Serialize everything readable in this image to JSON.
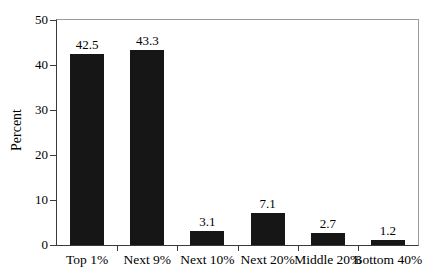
{
  "chart_data": {
    "type": "bar",
    "title": "",
    "xlabel": "",
    "ylabel": "Percent",
    "categories": [
      "Top 1%",
      "Next 9%",
      "Next 10%",
      "Next 20%",
      "Middle 20%",
      "Bottom 40%"
    ],
    "values": [
      42.5,
      43.3,
      3.1,
      7.1,
      2.7,
      1.2
    ],
    "value_labels": [
      "42.5",
      "43.3",
      "3.1",
      "7.1",
      "2.7",
      "1.2"
    ],
    "ylim": [
      0,
      50
    ],
    "yticks": [
      0,
      10,
      20,
      30,
      40,
      50
    ],
    "grid": false,
    "legend": "none",
    "bar_color": "#161616",
    "axis_color": "#3a3a3a",
    "frame_color": "#9a9a9a",
    "text_color": "#000000",
    "background_color": "#ffffff"
  }
}
